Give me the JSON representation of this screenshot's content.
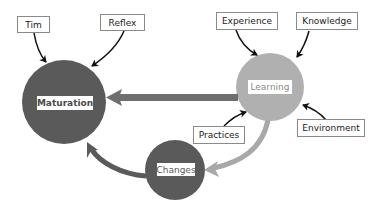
{
  "diagram": {
    "nodes": {
      "maturation": {
        "label": "Maturation",
        "color": "#5a5a5a"
      },
      "learning": {
        "label": "Learning",
        "color": "#b0b0b0"
      },
      "changes": {
        "label": "Changes",
        "color": "#5a5a5a"
      }
    },
    "inputs": {
      "tim": "Tim",
      "reflex": "Reflex",
      "experience": "Experience",
      "knowledge": "Knowledge",
      "practices": "Practices",
      "environment": "Environment"
    },
    "edges": [
      {
        "from": "Tim",
        "to": "Maturation"
      },
      {
        "from": "Reflex",
        "to": "Maturation"
      },
      {
        "from": "Experience",
        "to": "Learning"
      },
      {
        "from": "Knowledge",
        "to": "Learning"
      },
      {
        "from": "Practices",
        "to": "Learning"
      },
      {
        "from": "Environment",
        "to": "Learning"
      },
      {
        "from": "Learning",
        "to": "Maturation"
      },
      {
        "from": "Learning",
        "to": "Changes"
      },
      {
        "from": "Changes",
        "to": "Maturation"
      }
    ]
  }
}
